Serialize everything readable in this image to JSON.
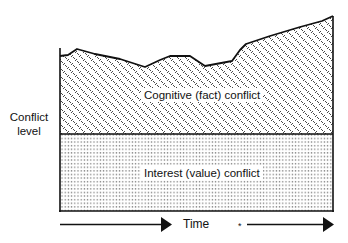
{
  "diagram": {
    "y_axis_label_line1": "Conflict",
    "y_axis_label_line2": "level",
    "upper_region_label": "Cognitive (fact) conflict",
    "lower_region_label": "Interest (value) conflict",
    "x_axis_label": "Time",
    "x_axis_marker": "*",
    "colors": {
      "line": "#111111",
      "background": "#ffffff",
      "hatch": "#333333",
      "dots": "#444444"
    },
    "icons": {
      "left_arrow": "arrow-right",
      "right_arrow": "arrow-right"
    }
  }
}
